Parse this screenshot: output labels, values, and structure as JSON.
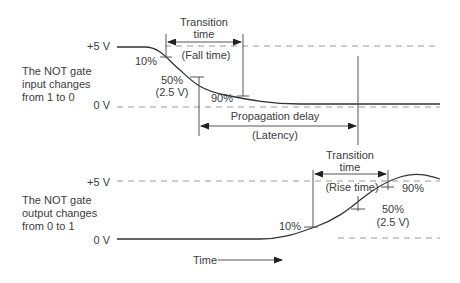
{
  "top": {
    "description": [
      "The NOT gate",
      "input changes",
      "from 1 to 0"
    ],
    "high_label": "+5 V",
    "low_label": "0 V",
    "transition_label": [
      "Transition",
      "time"
    ],
    "fall_label": "(Fall time)",
    "pct10": "10%",
    "pct50": "50%",
    "pct50_volts": "(2.5 V)",
    "pct90": "90%",
    "propagation_label": "Propagation delay",
    "latency_label": "(Latency)"
  },
  "bottom": {
    "description": [
      "The NOT gate",
      "output changes",
      "from 0 to 1"
    ],
    "high_label": "+5 V",
    "low_label": "0 V",
    "transition_label": [
      "Transition",
      "time"
    ],
    "rise_label": "(Rise time)",
    "pct10": "10%",
    "pct50": "50%",
    "pct50_volts": "(2.5 V)",
    "pct90": "90%"
  },
  "time_axis_label": "Time"
}
